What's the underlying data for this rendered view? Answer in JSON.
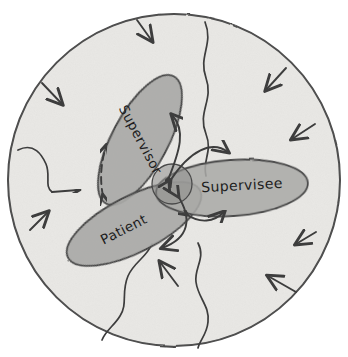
{
  "diagram": {
    "style": "hand-drawn sketch",
    "boundary": {
      "name": "system-boundary-circle",
      "shape": "circle",
      "fill_color": "#e9e8e5",
      "stroke_color": "#4a4a4a",
      "center": [
        174,
        180
      ],
      "radius": 166
    },
    "nodes": [
      {
        "id": "supervisor",
        "label": "Supervisor",
        "shape": "ellipse",
        "center": [
          140,
          140
        ],
        "rx": 72,
        "ry": 28,
        "rotation_deg": -62,
        "fill_color": "#a9a9a7",
        "stroke_color": "#4a4a4a"
      },
      {
        "id": "supervisee",
        "label": "Supervisee",
        "shape": "ellipse",
        "center": [
          232,
          188
        ],
        "rx": 76,
        "ry": 28,
        "rotation_deg": -4,
        "fill_color": "#a9a9a7",
        "stroke_color": "#4a4a4a"
      },
      {
        "id": "patient",
        "label": "Patient",
        "shape": "ellipse",
        "center": [
          134,
          224
        ],
        "rx": 74,
        "ry": 28,
        "rotation_deg": -27,
        "fill_color": "#a9a9a7",
        "stroke_color": "#4a4a4a"
      }
    ],
    "overlap": {
      "name": "triad-overlap-core",
      "center": [
        172,
        184
      ],
      "radius": 20,
      "fill_color": "#8e8e8c"
    },
    "connections": [
      {
        "id": "core-supervisor",
        "from": "core",
        "to": "supervisor",
        "style": "solid",
        "arrowheads": "double"
      },
      {
        "id": "core-supervisee",
        "from": "core",
        "to": "supervisee",
        "style": "solid",
        "arrowheads": "double"
      },
      {
        "id": "core-patient",
        "from": "core",
        "to": "patient",
        "style": "solid",
        "arrowheads": "double"
      },
      {
        "id": "patient-supervisor",
        "from": "patient",
        "to": "supervisor",
        "style": "dashed",
        "arrowheads": "double"
      }
    ],
    "boundary_influences": {
      "name": "external-influence-arrows",
      "description": "arrows pointing inward across the circle boundary",
      "count": 9
    },
    "boundary_permeability": {
      "name": "permeable-boundary-wavy-lines",
      "description": "wavy lines crossing the circle boundary",
      "count": 4
    },
    "colors": {
      "background": "#ffffff",
      "boundary_fill": "#e9e8e5",
      "node_fill": "#a9a9a7",
      "ink": "#3c3c3c",
      "text": "#1d1d1d"
    }
  }
}
